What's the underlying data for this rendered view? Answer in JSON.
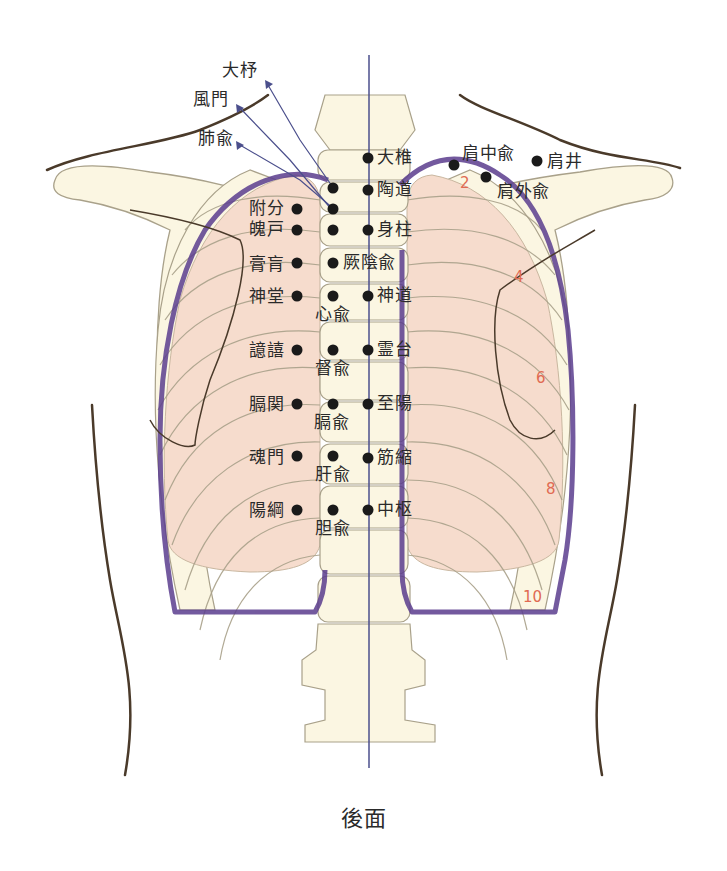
{
  "figure": {
    "caption": "後面",
    "colors": {
      "bone_fill": "#fbf6e2",
      "bone_stroke": "#a9a18a",
      "lung_fill": "#f6dccd",
      "pleura_line": "#5b3d8e",
      "skin_line": "#4a3a2a",
      "midline": "#4b4f8c",
      "rib_number": "#e06a52",
      "point": "#1a1a1a"
    }
  },
  "arrow_labels": [
    {
      "id": "daijo",
      "text": "大杼"
    },
    {
      "id": "fumon",
      "text": "風門"
    },
    {
      "id": "haiyu",
      "text": "肺兪"
    }
  ],
  "points": {
    "midline": [
      {
        "id": "daitsui",
        "text": "大椎"
      },
      {
        "id": "tondo",
        "text": "陶道"
      },
      {
        "id": "shinchu",
        "text": "身柱"
      },
      {
        "id": "shindo",
        "text": "神道"
      },
      {
        "id": "reidai",
        "text": "霊台"
      },
      {
        "id": "shiyo",
        "text": "至陽"
      },
      {
        "id": "kinshuku",
        "text": "筋縮"
      },
      {
        "id": "chusu",
        "text": "中枢"
      }
    ],
    "inner_bladder": [
      {
        "id": "ketsuinyu",
        "text": "厥陰兪"
      },
      {
        "id": "shinyu",
        "text": "心兪"
      },
      {
        "id": "tokuyu",
        "text": "督兪"
      },
      {
        "id": "kakuyu",
        "text": "膈兪"
      },
      {
        "id": "kanyu",
        "text": "肝兪"
      },
      {
        "id": "tanyu",
        "text": "胆兪"
      }
    ],
    "outer_bladder": [
      {
        "id": "fubun",
        "text": "附分"
      },
      {
        "id": "hakko",
        "text": "魄戸"
      },
      {
        "id": "kouko",
        "text": "膏肓"
      },
      {
        "id": "shindo2",
        "text": "神堂"
      },
      {
        "id": "iki",
        "text": "譩譆"
      },
      {
        "id": "kakukan",
        "text": "膈関"
      },
      {
        "id": "konmon",
        "text": "魂門"
      },
      {
        "id": "yoko",
        "text": "陽綱"
      }
    ],
    "shoulder": [
      {
        "id": "kenchuyu",
        "text": "肩中兪"
      },
      {
        "id": "kengaiyu",
        "text": "肩外兪"
      },
      {
        "id": "kensei",
        "text": "肩井"
      }
    ]
  },
  "rib_numbers": [
    "2",
    "4",
    "6",
    "8",
    "10"
  ]
}
